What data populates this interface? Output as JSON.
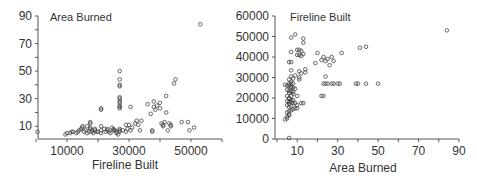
{
  "chart_data": [
    {
      "type": "scatter",
      "title": "Area Burned",
      "xlabel": "Fireline Built",
      "ylabel": "Area Burned",
      "xlim": [
        0,
        60000
      ],
      "ylim": [
        0,
        90
      ],
      "x_ticks": [
        0,
        10000,
        20000,
        30000,
        40000,
        50000,
        60000
      ],
      "x_tick_labels": [
        "10000",
        "30000",
        "50000"
      ],
      "x_tick_label_values": [
        10000,
        30000,
        50000
      ],
      "y_ticks": [
        10,
        20,
        30,
        40,
        50,
        60,
        70,
        80,
        90
      ],
      "y_tick_labels": [
        "10",
        "30",
        "50",
        "70",
        "90"
      ],
      "y_tick_label_values": [
        10,
        30,
        50,
        70,
        90
      ],
      "grid": false,
      "marker": "open-circle",
      "frame": {
        "x0": 36,
        "y0": 140,
        "x1": 222,
        "y1": 16,
        "axis_y": 139,
        "axis_x": 38
      }
    },
    {
      "type": "scatter",
      "title": "Fireline Built",
      "xlabel": "Area Burned",
      "ylabel": "Fireline Built",
      "xlim": [
        0,
        90
      ],
      "ylim": [
        0,
        60000
      ],
      "x_ticks": [
        0,
        10,
        20,
        30,
        40,
        50,
        60,
        70,
        80,
        90
      ],
      "x_tick_labels": [
        "10",
        "30",
        "50",
        "70",
        "90"
      ],
      "x_tick_label_values": [
        10,
        30,
        50,
        70,
        90
      ],
      "y_ticks": [
        0,
        10000,
        20000,
        30000,
        40000,
        50000,
        60000
      ],
      "y_tick_labels": [
        "0",
        "10000",
        "20000",
        "30000",
        "40000",
        "50000",
        "60000"
      ],
      "y_tick_label_values": [
        0,
        10000,
        20000,
        30000,
        40000,
        50000,
        60000
      ],
      "grid": false,
      "marker": "open-circle",
      "frame": {
        "x0": 277,
        "y0": 139,
        "x1": 459,
        "y1": 16,
        "axis_y": 139,
        "axis_x": 275
      }
    }
  ],
  "points": [
    [
      500,
      6
    ],
    [
      9500,
      4
    ],
    [
      10000,
      5
    ],
    [
      11000,
      5
    ],
    [
      11500,
      6
    ],
    [
      12000,
      6
    ],
    [
      13000,
      5
    ],
    [
      13500,
      6
    ],
    [
      14000,
      7
    ],
    [
      14500,
      8
    ],
    [
      15000,
      9
    ],
    [
      15000,
      10
    ],
    [
      15500,
      6
    ],
    [
      16000,
      7
    ],
    [
      16500,
      5
    ],
    [
      17000,
      6
    ],
    [
      17500,
      8
    ],
    [
      17500,
      9
    ],
    [
      17500,
      12
    ],
    [
      17500,
      13
    ],
    [
      18000,
      6
    ],
    [
      18000,
      7
    ],
    [
      18500,
      5
    ],
    [
      19000,
      7
    ],
    [
      19500,
      6
    ],
    [
      20000,
      6
    ],
    [
      21000,
      5
    ],
    [
      21000,
      7
    ],
    [
      21000,
      22
    ],
    [
      21000,
      23
    ],
    [
      21000,
      10
    ],
    [
      22000,
      8
    ],
    [
      22500,
      6
    ],
    [
      23000,
      7
    ],
    [
      23500,
      6
    ],
    [
      24000,
      5
    ],
    [
      24500,
      9
    ],
    [
      25000,
      8
    ],
    [
      25500,
      7
    ],
    [
      26000,
      6
    ],
    [
      26000,
      5
    ],
    [
      26500,
      4
    ],
    [
      27000,
      6
    ],
    [
      27000,
      7
    ],
    [
      27000,
      8
    ],
    [
      27000,
      23
    ],
    [
      27000,
      24
    ],
    [
      27000,
      25
    ],
    [
      27000,
      27
    ],
    [
      27000,
      28
    ],
    [
      27000,
      30
    ],
    [
      27000,
      31
    ],
    [
      27000,
      39
    ],
    [
      27000,
      40
    ],
    [
      27000,
      44
    ],
    [
      27000,
      50
    ],
    [
      28000,
      7
    ],
    [
      29000,
      6
    ],
    [
      29500,
      8
    ],
    [
      29000,
      11
    ],
    [
      30000,
      11
    ],
    [
      30500,
      24
    ],
    [
      30500,
      7
    ],
    [
      31000,
      9
    ],
    [
      32000,
      12
    ],
    [
      32500,
      14
    ],
    [
      33000,
      11
    ],
    [
      33500,
      7
    ],
    [
      34000,
      14
    ],
    [
      36000,
      26
    ],
    [
      37000,
      19
    ],
    [
      37500,
      6
    ],
    [
      38000,
      24
    ],
    [
      38000,
      28
    ],
    [
      38500,
      22
    ],
    [
      39000,
      25
    ],
    [
      40000,
      27
    ],
    [
      40000,
      23
    ],
    [
      40500,
      12
    ],
    [
      41000,
      10
    ],
    [
      41000,
      11
    ],
    [
      41500,
      13
    ],
    [
      42000,
      32
    ],
    [
      42000,
      20
    ],
    [
      42500,
      7
    ],
    [
      43000,
      12
    ],
    [
      43500,
      10
    ],
    [
      43500,
      11
    ],
    [
      44500,
      41
    ],
    [
      45000,
      44
    ],
    [
      47000,
      13
    ],
    [
      49000,
      13
    ],
    [
      49500,
      7
    ],
    [
      51000,
      9
    ],
    [
      53000,
      84
    ],
    [
      37500,
      7
    ],
    [
      16500,
      10
    ],
    [
      25000,
      7
    ],
    [
      23000,
      8
    ],
    [
      19000,
      8
    ]
  ]
}
